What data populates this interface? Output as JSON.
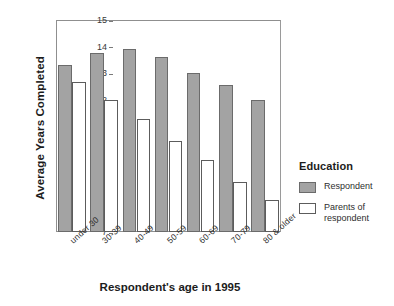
{
  "chart_data": {
    "type": "bar",
    "title": "",
    "xlabel": "Respondent's age in 1995",
    "ylabel": "Average Years Completed",
    "ylim": [
      7,
      15
    ],
    "yticks": [
      7,
      8,
      9,
      10,
      11,
      12,
      13,
      14,
      15
    ],
    "grid": false,
    "legend_position": "right",
    "legend_title": "Education",
    "categories": [
      "under 30",
      "30-39",
      "40-49",
      "50-59",
      "60-69",
      "70-79",
      "80 & older"
    ],
    "series": [
      {
        "name": "Respondent",
        "color": "#a3a3a3",
        "values": [
          13.3,
          13.75,
          13.9,
          13.6,
          13.0,
          12.55,
          12.0
        ]
      },
      {
        "name": "Parents of respondent",
        "color": "#ffffff",
        "values": [
          12.65,
          12.0,
          11.25,
          10.45,
          9.7,
          8.9,
          8.2
        ]
      }
    ]
  },
  "axes": {
    "y_title": "Average Years Completed",
    "x_title": "Respondent's age in 1995"
  },
  "legend": {
    "title": "Education",
    "items": [
      {
        "label": "Respondent"
      },
      {
        "label": "Parents of respondent"
      }
    ]
  }
}
